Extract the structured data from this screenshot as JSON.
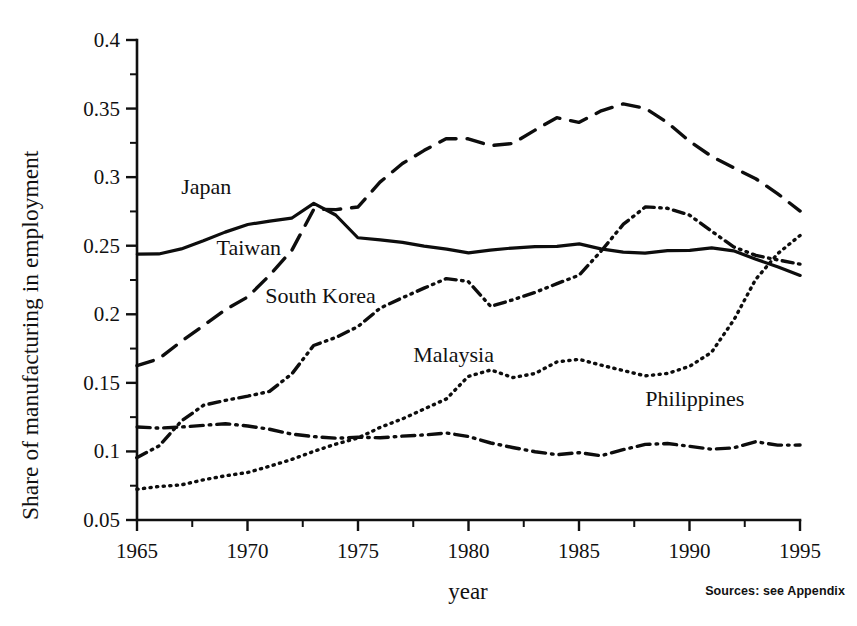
{
  "figure": {
    "source_note": "Sources: see Appendix"
  },
  "chart_data": {
    "type": "line",
    "title": "",
    "xlabel": "year",
    "ylabel": "Share of manufacturing in employment",
    "xlim": [
      1965,
      1995
    ],
    "ylim": [
      0.05,
      0.4
    ],
    "grid": false,
    "legend": "inline-labels",
    "x_ticks": [
      1965,
      1970,
      1975,
      1980,
      1985,
      1990,
      1995
    ],
    "x_tick_labels": [
      "1965",
      "1970",
      "1975",
      "1980",
      "1985",
      "1990",
      "1995"
    ],
    "x_minor_ticks": [
      1967.5,
      1972.5,
      1977.5,
      1982.5,
      1987.5,
      1992.5
    ],
    "y_ticks": [
      0.05,
      0.1,
      0.15,
      0.2,
      0.25,
      0.3,
      0.35,
      0.4
    ],
    "y_tick_labels": [
      "0.05",
      "0.1",
      "0.15",
      "0.2",
      "0.25",
      "0.3",
      "0.35",
      "0.4"
    ],
    "y_minor_ticks": [
      0.075,
      0.125,
      0.175,
      0.225,
      0.275,
      0.325,
      0.375
    ],
    "x": [
      1965,
      1966,
      1967,
      1968,
      1969,
      1970,
      1971,
      1972,
      1973,
      1974,
      1975,
      1976,
      1977,
      1978,
      1979,
      1980,
      1981,
      1982,
      1983,
      1984,
      1985,
      1986,
      1987,
      1988,
      1989,
      1990,
      1991,
      1992,
      1993,
      1994,
      1995
    ],
    "series": [
      {
        "name": "Japan",
        "style": "solid",
        "label_x": 1967.0,
        "label_y": 0.288,
        "values": [
          0.244,
          0.244,
          0.248,
          0.254,
          0.26,
          0.265,
          0.268,
          0.27,
          0.281,
          0.272,
          0.256,
          0.254,
          0.252,
          0.25,
          0.247,
          0.245,
          0.247,
          0.248,
          0.249,
          0.249,
          0.251,
          0.248,
          0.245,
          0.245,
          0.246,
          0.247,
          0.248,
          0.246,
          0.24,
          0.234,
          0.228
        ]
      },
      {
        "name": "Taiwan",
        "style": "dashed",
        "label_x": 1968.6,
        "label_y": 0.243,
        "values": [
          0.163,
          0.168,
          0.18,
          0.192,
          0.203,
          0.213,
          0.228,
          0.247,
          0.277,
          0.276,
          0.278,
          0.296,
          0.31,
          0.32,
          0.328,
          0.328,
          0.323,
          0.325,
          0.334,
          0.343,
          0.34,
          0.348,
          0.353,
          0.35,
          0.34,
          0.326,
          0.315,
          0.307,
          0.299,
          0.288,
          0.275
        ]
      },
      {
        "name": "South Korea",
        "style": "dashdotdot",
        "label_x": 1970.8,
        "label_y": 0.208,
        "values": [
          0.095,
          0.104,
          0.122,
          0.134,
          0.137,
          0.14,
          0.144,
          0.157,
          0.177,
          0.183,
          0.191,
          0.205,
          0.212,
          0.219,
          0.226,
          0.224,
          0.206,
          0.211,
          0.216,
          0.222,
          0.228,
          0.246,
          0.266,
          0.278,
          0.277,
          0.272,
          0.261,
          0.249,
          0.243,
          0.24,
          0.237
        ]
      },
      {
        "name": "Malaysia",
        "style": "dotted",
        "label_x": 1977.5,
        "label_y": 0.165,
        "values": [
          0.072,
          0.074,
          0.076,
          0.079,
          0.082,
          0.085,
          0.089,
          0.094,
          0.1,
          0.105,
          0.11,
          0.117,
          0.124,
          0.131,
          0.138,
          0.155,
          0.159,
          0.154,
          0.157,
          0.165,
          0.167,
          0.163,
          0.159,
          0.155,
          0.157,
          0.162,
          0.172,
          0.196,
          0.225,
          0.244,
          0.258
        ]
      },
      {
        "name": "Philippines",
        "style": "dashdot",
        "label_x": 1988.0,
        "label_y": 0.133,
        "values": [
          0.118,
          0.117,
          0.118,
          0.119,
          0.12,
          0.119,
          0.116,
          0.113,
          0.111,
          0.11,
          0.11,
          0.11,
          0.111,
          0.112,
          0.113,
          0.111,
          0.106,
          0.103,
          0.1,
          0.098,
          0.099,
          0.097,
          0.101,
          0.105,
          0.106,
          0.104,
          0.102,
          0.103,
          0.107,
          0.105,
          0.105
        ]
      }
    ]
  }
}
